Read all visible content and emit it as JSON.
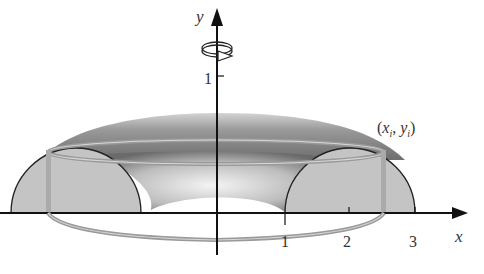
{
  "figure": {
    "type": "solid-of-revolution",
    "axes": {
      "x_label": "x",
      "y_label": "y",
      "x_ticks": [
        {
          "value": 1,
          "label": "1"
        },
        {
          "value": 2,
          "label": "2"
        },
        {
          "value": 3,
          "label": "3"
        }
      ],
      "y_ticks": [
        {
          "value": 1,
          "label": "1"
        }
      ]
    },
    "point_label": {
      "open": "(",
      "x": "x",
      "sub_x": "i",
      "comma": ", ",
      "y": "y",
      "sub_y": "i",
      "close": ")"
    },
    "rotation_icon": "rotation-arrow-icon",
    "colors": {
      "axis": "#111111",
      "region_fill": "#c4c4c4",
      "surface_dark": "#7c7c7c",
      "surface_light": "#e0e0e0",
      "ring": "#9a9a9a"
    }
  }
}
